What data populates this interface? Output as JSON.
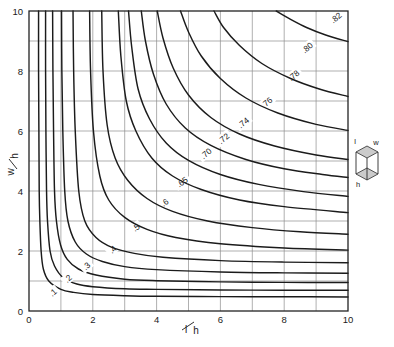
{
  "chart_data": {
    "type": "line",
    "title": "",
    "subtitle": "",
    "xlabel_numerator": "l",
    "xlabel_denominator": "h",
    "xlabel": "l/h",
    "ylabel_numerator": "w",
    "ylabel_denominator": "h",
    "ylabel": "w/h",
    "xlim": [
      0,
      10
    ],
    "ylim": [
      0,
      10
    ],
    "xticks": [
      0,
      2,
      4,
      6,
      8,
      10
    ],
    "yticks": [
      0,
      2,
      4,
      6,
      8,
      10
    ],
    "xtick_labels": [
      "0",
      "2",
      "4",
      "6",
      "8",
      "10"
    ],
    "ytick_labels": [
      "0",
      "2",
      "4",
      "6",
      "8",
      "10"
    ],
    "x_minor_step": 1,
    "y_minor_step": 1,
    "grid": true,
    "grid_color": "#8e8e8e",
    "legend_position": "none",
    "line_color": "#1b1b1b",
    "annotation_note": "Contours of constant view factor / shape factor plotted against l/h and w/h for a rectangular enclosure.",
    "series": [
      {
        "name": ".1",
        "label": ".1",
        "label_x": 0.75,
        "label_y": 0.62,
        "label_rotation": -42,
        "values": [
          {
            "x": 0.3,
            "y": 10.0
          },
          {
            "x": 0.3,
            "y": 8.0
          },
          {
            "x": 0.31,
            "y": 6.0
          },
          {
            "x": 0.32,
            "y": 4.0
          },
          {
            "x": 0.34,
            "y": 3.0
          },
          {
            "x": 0.38,
            "y": 2.0
          },
          {
            "x": 0.45,
            "y": 1.4
          },
          {
            "x": 0.62,
            "y": 1.0
          },
          {
            "x": 1.0,
            "y": 0.72
          },
          {
            "x": 1.4,
            "y": 0.62
          },
          {
            "x": 2.0,
            "y": 0.55
          },
          {
            "x": 3.0,
            "y": 0.51
          },
          {
            "x": 4.0,
            "y": 0.49
          },
          {
            "x": 6.0,
            "y": 0.48
          },
          {
            "x": 8.0,
            "y": 0.475
          },
          {
            "x": 10.0,
            "y": 0.47
          }
        ]
      },
      {
        "name": ".2",
        "label": ".2",
        "label_x": 1.22,
        "label_y": 1.08,
        "label_rotation": -42,
        "values": [
          {
            "x": 0.52,
            "y": 10.0
          },
          {
            "x": 0.52,
            "y": 8.0
          },
          {
            "x": 0.53,
            "y": 6.0
          },
          {
            "x": 0.55,
            "y": 4.0
          },
          {
            "x": 0.58,
            "y": 3.0
          },
          {
            "x": 0.66,
            "y": 2.0
          },
          {
            "x": 0.8,
            "y": 1.5
          },
          {
            "x": 1.08,
            "y": 1.1
          },
          {
            "x": 1.5,
            "y": 0.9
          },
          {
            "x": 2.0,
            "y": 0.81
          },
          {
            "x": 3.0,
            "y": 0.74
          },
          {
            "x": 4.0,
            "y": 0.72
          },
          {
            "x": 6.0,
            "y": 0.7
          },
          {
            "x": 8.0,
            "y": 0.695
          },
          {
            "x": 10.0,
            "y": 0.69
          }
        ]
      },
      {
        "name": ".3",
        "label": ".3",
        "label_x": 1.8,
        "label_y": 1.5,
        "label_rotation": -42,
        "values": [
          {
            "x": 0.74,
            "y": 10.0
          },
          {
            "x": 0.75,
            "y": 8.0
          },
          {
            "x": 0.77,
            "y": 6.0
          },
          {
            "x": 0.8,
            "y": 4.0
          },
          {
            "x": 0.86,
            "y": 3.0
          },
          {
            "x": 0.99,
            "y": 2.2
          },
          {
            "x": 1.2,
            "y": 1.72
          },
          {
            "x": 1.55,
            "y": 1.4
          },
          {
            "x": 2.1,
            "y": 1.2
          },
          {
            "x": 3.0,
            "y": 1.06
          },
          {
            "x": 4.0,
            "y": 1.01
          },
          {
            "x": 6.0,
            "y": 0.97
          },
          {
            "x": 8.0,
            "y": 0.955
          },
          {
            "x": 10.0,
            "y": 0.95
          }
        ]
      },
      {
        "name": ".4",
        "label": ".4",
        "label_x": 2.62,
        "label_y": 2.05,
        "label_rotation": -42,
        "values": [
          {
            "x": 1.02,
            "y": 10.0
          },
          {
            "x": 1.03,
            "y": 8.0
          },
          {
            "x": 1.06,
            "y": 6.0
          },
          {
            "x": 1.12,
            "y": 4.0
          },
          {
            "x": 1.22,
            "y": 3.0
          },
          {
            "x": 1.45,
            "y": 2.3
          },
          {
            "x": 1.8,
            "y": 1.9
          },
          {
            "x": 2.3,
            "y": 1.65
          },
          {
            "x": 3.0,
            "y": 1.48
          },
          {
            "x": 4.0,
            "y": 1.38
          },
          {
            "x": 6.0,
            "y": 1.3
          },
          {
            "x": 8.0,
            "y": 1.27
          },
          {
            "x": 10.0,
            "y": 1.26
          }
        ]
      },
      {
        "name": ".5",
        "label": ".5",
        "label_x": 3.35,
        "label_y": 2.78,
        "label_rotation": -38,
        "values": [
          {
            "x": 1.38,
            "y": 10.0
          },
          {
            "x": 1.4,
            "y": 8.0
          },
          {
            "x": 1.45,
            "y": 6.0
          },
          {
            "x": 1.56,
            "y": 4.0
          },
          {
            "x": 1.75,
            "y": 3.0
          },
          {
            "x": 2.1,
            "y": 2.45
          },
          {
            "x": 2.6,
            "y": 2.12
          },
          {
            "x": 3.3,
            "y": 1.92
          },
          {
            "x": 4.2,
            "y": 1.79
          },
          {
            "x": 6.0,
            "y": 1.68
          },
          {
            "x": 8.0,
            "y": 1.63
          },
          {
            "x": 10.0,
            "y": 1.61
          }
        ]
      },
      {
        "name": ".6",
        "label": ".6",
        "label_x": 4.25,
        "label_y": 3.62,
        "label_rotation": -36,
        "values": [
          {
            "x": 1.9,
            "y": 10.0
          },
          {
            "x": 1.93,
            "y": 8.0
          },
          {
            "x": 2.02,
            "y": 6.0
          },
          {
            "x": 2.22,
            "y": 4.5
          },
          {
            "x": 2.5,
            "y": 3.7
          },
          {
            "x": 3.0,
            "y": 3.12
          },
          {
            "x": 3.7,
            "y": 2.72
          },
          {
            "x": 4.6,
            "y": 2.45
          },
          {
            "x": 6.0,
            "y": 2.24
          },
          {
            "x": 8.0,
            "y": 2.1
          },
          {
            "x": 10.0,
            "y": 2.03
          }
        ]
      },
      {
        "name": ".65",
        "label": ".65",
        "label_x": 4.8,
        "label_y": 4.3,
        "label_rotation": -36,
        "values": [
          {
            "x": 2.28,
            "y": 10.0
          },
          {
            "x": 2.32,
            "y": 8.0
          },
          {
            "x": 2.45,
            "y": 6.2
          },
          {
            "x": 2.7,
            "y": 5.1
          },
          {
            "x": 3.1,
            "y": 4.35
          },
          {
            "x": 3.7,
            "y": 3.75
          },
          {
            "x": 4.5,
            "y": 3.32
          },
          {
            "x": 5.6,
            "y": 3.0
          },
          {
            "x": 7.0,
            "y": 2.78
          },
          {
            "x": 8.5,
            "y": 2.64
          },
          {
            "x": 10.0,
            "y": 2.56
          }
        ]
      },
      {
        "name": ".70",
        "label": ".70",
        "label_x": 5.55,
        "label_y": 5.25,
        "label_rotation": -40,
        "values": [
          {
            "x": 2.8,
            "y": 10.0
          },
          {
            "x": 2.88,
            "y": 8.5
          },
          {
            "x": 3.05,
            "y": 7.0
          },
          {
            "x": 3.35,
            "y": 6.0
          },
          {
            "x": 3.85,
            "y": 5.1
          },
          {
            "x": 4.5,
            "y": 4.5
          },
          {
            "x": 5.4,
            "y": 4.05
          },
          {
            "x": 6.6,
            "y": 3.7
          },
          {
            "x": 8.0,
            "y": 3.48
          },
          {
            "x": 10.0,
            "y": 3.28
          }
        ]
      },
      {
        "name": ".72",
        "label": ".72",
        "label_x": 6.1,
        "label_y": 5.75,
        "label_rotation": -40,
        "values": [
          {
            "x": 3.12,
            "y": 10.0
          },
          {
            "x": 3.22,
            "y": 8.8
          },
          {
            "x": 3.42,
            "y": 7.4
          },
          {
            "x": 3.78,
            "y": 6.4
          },
          {
            "x": 4.3,
            "y": 5.6
          },
          {
            "x": 5.0,
            "y": 5.02
          },
          {
            "x": 6.0,
            "y": 4.55
          },
          {
            "x": 7.2,
            "y": 4.22
          },
          {
            "x": 8.6,
            "y": 3.98
          },
          {
            "x": 10.0,
            "y": 3.82
          }
        ]
      },
      {
        "name": ".74",
        "label": ".74",
        "label_x": 6.72,
        "label_y": 6.28,
        "label_rotation": -40,
        "values": [
          {
            "x": 3.52,
            "y": 10.0
          },
          {
            "x": 3.65,
            "y": 9.0
          },
          {
            "x": 3.9,
            "y": 7.9
          },
          {
            "x": 4.3,
            "y": 6.9
          },
          {
            "x": 4.9,
            "y": 6.1
          },
          {
            "x": 5.7,
            "y": 5.52
          },
          {
            "x": 6.8,
            "y": 5.05
          },
          {
            "x": 8.0,
            "y": 4.74
          },
          {
            "x": 9.2,
            "y": 4.55
          },
          {
            "x": 10.0,
            "y": 4.45
          }
        ]
      },
      {
        "name": ".76",
        "label": ".76",
        "label_x": 7.45,
        "label_y": 6.95,
        "label_rotation": -40,
        "values": [
          {
            "x": 4.02,
            "y": 10.0
          },
          {
            "x": 4.2,
            "y": 9.1
          },
          {
            "x": 4.52,
            "y": 8.1
          },
          {
            "x": 5.0,
            "y": 7.2
          },
          {
            "x": 5.7,
            "y": 6.45
          },
          {
            "x": 6.6,
            "y": 5.9
          },
          {
            "x": 7.7,
            "y": 5.5
          },
          {
            "x": 9.0,
            "y": 5.2
          },
          {
            "x": 10.0,
            "y": 5.05
          }
        ]
      },
      {
        "name": ".78",
        "label": ".78",
        "label_x": 8.3,
        "label_y": 7.85,
        "label_rotation": -40,
        "values": [
          {
            "x": 4.75,
            "y": 10.0
          },
          {
            "x": 5.0,
            "y": 9.3
          },
          {
            "x": 5.4,
            "y": 8.5
          },
          {
            "x": 6.0,
            "y": 7.75
          },
          {
            "x": 6.8,
            "y": 7.1
          },
          {
            "x": 7.8,
            "y": 6.6
          },
          {
            "x": 9.0,
            "y": 6.22
          },
          {
            "x": 10.0,
            "y": 6.02
          }
        ]
      },
      {
        "name": ".80",
        "label": ".80",
        "label_x": 8.72,
        "label_y": 8.78,
        "label_rotation": -40,
        "values": [
          {
            "x": 5.8,
            "y": 10.0
          },
          {
            "x": 6.1,
            "y": 9.45
          },
          {
            "x": 6.6,
            "y": 8.85
          },
          {
            "x": 7.3,
            "y": 8.25
          },
          {
            "x": 8.2,
            "y": 7.75
          },
          {
            "x": 9.1,
            "y": 7.4
          },
          {
            "x": 10.0,
            "y": 7.15
          }
        ]
      },
      {
        "name": ".82",
        "label": ".82",
        "label_x": 9.62,
        "label_y": 9.78,
        "label_rotation": -40,
        "values": [
          {
            "x": 7.75,
            "y": 10.0
          },
          {
            "x": 8.2,
            "y": 9.72
          },
          {
            "x": 8.7,
            "y": 9.45
          },
          {
            "x": 9.3,
            "y": 9.2
          },
          {
            "x": 10.0,
            "y": 8.98
          }
        ]
      }
    ]
  },
  "diagram": {
    "name": "rectangular-enclosure-box",
    "label_l": "l",
    "label_w": "w",
    "label_h": "h"
  }
}
